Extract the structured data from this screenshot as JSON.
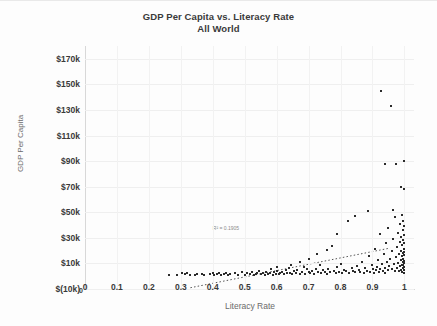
{
  "chart_data": {
    "type": "scatter",
    "title": "GDP Per Capita vs. Literacy Rate",
    "subtitle": "All World",
    "xlabel": "Literacy Rate",
    "ylabel": "GDP Per Capita",
    "xlim": [
      0,
      1.03
    ],
    "ylim": [
      -10000,
      180000
    ],
    "grid": true,
    "legend": "none",
    "annotation": "R² = 0.1905",
    "annotation_x": 0.4,
    "annotation_y": 40000,
    "xticks": [
      "0",
      "0.1",
      "0.2",
      "0.3",
      "0.4",
      "0.5",
      "0.6",
      "0.7",
      "0.8",
      "0.9",
      "1"
    ],
    "xtick_values": [
      0,
      0.1,
      0.2,
      0.3,
      0.4,
      0.5,
      0.6,
      0.7,
      0.8,
      0.9,
      1.0
    ],
    "yticks": [
      "$(10k)",
      "$10k",
      "$30k",
      "$50k",
      "$70k",
      "$90k",
      "$110k",
      "$130k",
      "$150k",
      "$170k"
    ],
    "ytick_values": [
      -10000,
      10000,
      30000,
      50000,
      70000,
      90000,
      110000,
      130000,
      150000,
      170000
    ],
    "origin_label": "0",
    "trendline": {
      "style": "dotted",
      "color": "#555555",
      "x_start": 0.33,
      "y_start": -9000,
      "x_end": 0.955,
      "y_end": 22000
    },
    "points": [
      [
        0.262,
        1200
      ],
      [
        0.288,
        900
      ],
      [
        0.305,
        2400
      ],
      [
        0.312,
        1500
      ],
      [
        0.318,
        2600
      ],
      [
        0.33,
        1000
      ],
      [
        0.345,
        800
      ],
      [
        0.352,
        1400
      ],
      [
        0.365,
        2100
      ],
      [
        0.372,
        900
      ],
      [
        0.39,
        1800
      ],
      [
        0.4,
        2600
      ],
      [
        0.405,
        1200
      ],
      [
        0.412,
        2000
      ],
      [
        0.418,
        2400
      ],
      [
        0.425,
        900
      ],
      [
        0.435,
        1600
      ],
      [
        0.44,
        2800
      ],
      [
        0.448,
        1100
      ],
      [
        0.455,
        1900
      ],
      [
        0.47,
        2200
      ],
      [
        0.478,
        1300
      ],
      [
        0.49,
        3000
      ],
      [
        0.5,
        1000
      ],
      [
        0.508,
        2500
      ],
      [
        0.515,
        1700
      ],
      [
        0.522,
        3300
      ],
      [
        0.53,
        1200
      ],
      [
        0.535,
        2000
      ],
      [
        0.54,
        2700
      ],
      [
        0.545,
        4400
      ],
      [
        0.552,
        1500
      ],
      [
        0.558,
        2900
      ],
      [
        0.562,
        900
      ],
      [
        0.568,
        3600
      ],
      [
        0.572,
        1800
      ],
      [
        0.578,
        2300
      ],
      [
        0.582,
        5600
      ],
      [
        0.588,
        1100
      ],
      [
        0.592,
        3100
      ],
      [
        0.598,
        2000
      ],
      [
        0.602,
        4000
      ],
      [
        0.608,
        1400
      ],
      [
        0.612,
        2700
      ],
      [
        0.618,
        3400
      ],
      [
        0.622,
        1900
      ],
      [
        0.628,
        5000
      ],
      [
        0.632,
        2200
      ],
      [
        0.638,
        6600
      ],
      [
        0.642,
        2800
      ],
      [
        0.648,
        1600
      ],
      [
        0.655,
        3800
      ],
      [
        0.66,
        2400
      ],
      [
        0.665,
        4600
      ],
      [
        0.672,
        1800
      ],
      [
        0.678,
        3000
      ],
      [
        0.685,
        7200
      ],
      [
        0.69,
        2100
      ],
      [
        0.695,
        5400
      ],
      [
        0.7,
        3500
      ],
      [
        0.705,
        2600
      ],
      [
        0.712,
        4200
      ],
      [
        0.718,
        1900
      ],
      [
        0.722,
        6000
      ],
      [
        0.728,
        3200
      ],
      [
        0.735,
        8800
      ],
      [
        0.74,
        2400
      ],
      [
        0.745,
        4800
      ],
      [
        0.752,
        3600
      ],
      [
        0.758,
        2000
      ],
      [
        0.762,
        5800
      ],
      [
        0.768,
        3000
      ],
      [
        0.772,
        24000
      ],
      [
        0.778,
        4000
      ],
      [
        0.785,
        2600
      ],
      [
        0.79,
        7000
      ],
      [
        0.795,
        3400
      ],
      [
        0.8,
        9500
      ],
      [
        0.805,
        2800
      ],
      [
        0.812,
        5200
      ],
      [
        0.818,
        3800
      ],
      [
        0.822,
        43000
      ],
      [
        0.828,
        2400
      ],
      [
        0.835,
        6400
      ],
      [
        0.84,
        4400
      ],
      [
        0.845,
        3000
      ],
      [
        0.852,
        8200
      ],
      [
        0.858,
        5000
      ],
      [
        0.862,
        3600
      ],
      [
        0.868,
        11000
      ],
      [
        0.872,
        2800
      ],
      [
        0.878,
        6800
      ],
      [
        0.882,
        4200
      ],
      [
        0.888,
        15500
      ],
      [
        0.892,
        3400
      ],
      [
        0.898,
        9000
      ],
      [
        0.902,
        5600
      ],
      [
        0.905,
        2600
      ],
      [
        0.908,
        21000
      ],
      [
        0.912,
        4600
      ],
      [
        0.915,
        7400
      ],
      [
        0.918,
        12500
      ],
      [
        0.92,
        3200
      ],
      [
        0.922,
        33000
      ],
      [
        0.925,
        5800
      ],
      [
        0.928,
        145000
      ],
      [
        0.93,
        9800
      ],
      [
        0.932,
        4000
      ],
      [
        0.935,
        17000
      ],
      [
        0.938,
        6600
      ],
      [
        0.94,
        2800
      ],
      [
        0.942,
        26000
      ],
      [
        0.945,
        11500
      ],
      [
        0.948,
        4800
      ],
      [
        0.95,
        38000
      ],
      [
        0.952,
        8000
      ],
      [
        0.955,
        13800
      ],
      [
        0.958,
        133000
      ],
      [
        0.96,
        5400
      ],
      [
        0.962,
        19500
      ],
      [
        0.965,
        29000
      ],
      [
        0.968,
        9200
      ],
      [
        0.97,
        3800
      ],
      [
        0.972,
        46000
      ],
      [
        0.974,
        15000
      ],
      [
        0.975,
        88000
      ],
      [
        0.976,
        6800
      ],
      [
        0.978,
        23000
      ],
      [
        0.98,
        10500
      ],
      [
        0.981,
        34000
      ],
      [
        0.982,
        4400
      ],
      [
        0.984,
        17500
      ],
      [
        0.985,
        27000
      ],
      [
        0.986,
        7600
      ],
      [
        0.987,
        41000
      ],
      [
        0.988,
        13000
      ],
      [
        0.989,
        5000
      ],
      [
        0.99,
        20000
      ],
      [
        0.99,
        31000
      ],
      [
        0.991,
        9000
      ],
      [
        0.992,
        48000
      ],
      [
        0.992,
        15500
      ],
      [
        0.993,
        3600
      ],
      [
        0.993,
        24500
      ],
      [
        0.994,
        11000
      ],
      [
        0.994,
        36000
      ],
      [
        0.995,
        6200
      ],
      [
        0.995,
        18500
      ],
      [
        0.996,
        28500
      ],
      [
        0.996,
        8400
      ],
      [
        0.997,
        43500
      ],
      [
        0.997,
        13500
      ],
      [
        0.998,
        21500
      ],
      [
        0.998,
        4600
      ],
      [
        0.998,
        32000
      ],
      [
        0.999,
        10000
      ],
      [
        0.999,
        16500
      ],
      [
        0.999,
        26000
      ],
      [
        1.0,
        2600
      ],
      [
        1.0,
        7000
      ],
      [
        1.0,
        12000
      ],
      [
        1.0,
        19000
      ],
      [
        1.0,
        39000
      ],
      [
        1.0,
        90000
      ],
      [
        0.998,
        68000
      ],
      [
        0.99,
        70000
      ],
      [
        0.938,
        88000
      ],
      [
        0.965,
        52000
      ],
      [
        0.886,
        51000
      ],
      [
        0.845,
        47000
      ],
      [
        0.788,
        33000
      ],
      [
        0.758,
        20500
      ],
      [
        0.725,
        17000
      ],
      [
        0.7,
        13500
      ],
      [
        0.672,
        11000
      ],
      [
        0.646,
        9000
      ],
      [
        0.6,
        7200
      ]
    ]
  }
}
